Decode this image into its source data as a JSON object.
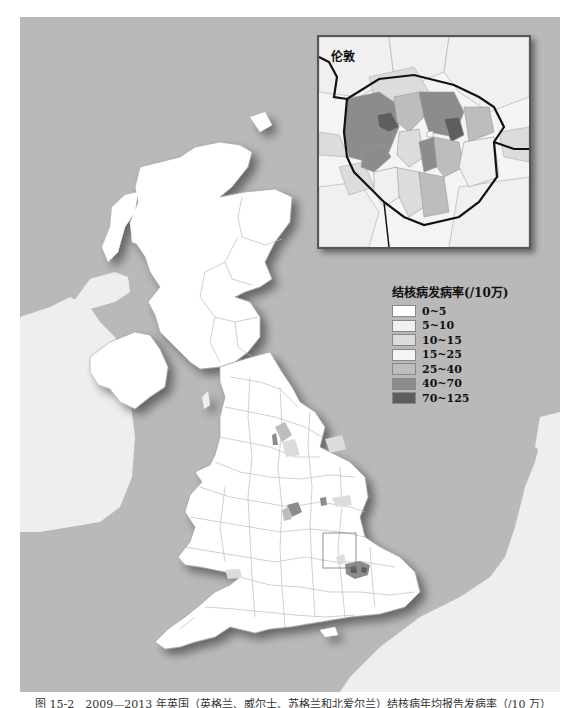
{
  "map": {
    "title": "结核病年均报告发病率地图（英国）",
    "inset": {
      "label": "伦敦"
    },
    "legend": {
      "title": "结核病发病率(/10万)",
      "items": [
        {
          "label": "0~5",
          "color": "#ffffff"
        },
        {
          "label": "5~10",
          "color": "#f0f0f0"
        },
        {
          "label": "10~15",
          "color": "#dcdcdc"
        },
        {
          "label": "15~25",
          "color": "#f4f4f4"
        },
        {
          "label": "25~40",
          "color": "#bdbdbd"
        },
        {
          "label": "40~70",
          "color": "#8c8c8c"
        },
        {
          "label": "70~125",
          "color": "#5e5e5e"
        }
      ]
    },
    "colors": {
      "sea": "#b9b9b9",
      "land_uk": "#ffffff",
      "land_other": "#eeeeee",
      "boundary": "#bbbbbb"
    }
  },
  "caption": "图 15-2　2009—2013 年英国（英格兰、威尔士、苏格兰和北爱尔兰）结核病年均报告发病率（/10 万）"
}
